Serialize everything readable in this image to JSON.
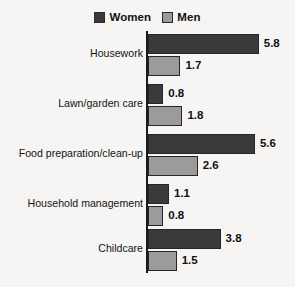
{
  "chart_data": {
    "type": "bar",
    "orientation": "horizontal",
    "title": "",
    "subtitle": "",
    "xlabel": "",
    "ylabel": "",
    "grid": false,
    "legend_position": "top-center",
    "xlim": [
      0,
      5.8
    ],
    "axis_tick_labels": [],
    "categories": [
      "Housework",
      "Lawn/garden care",
      "Food preparation/clean-up",
      "Household management",
      "Childcare"
    ],
    "series": [
      {
        "name": "Women",
        "color": "#3a3a3a",
        "values": [
          5.8,
          0.8,
          5.6,
          1.1,
          3.8
        ],
        "value_labels": [
          "5.8",
          "0.8",
          "5.6",
          "1.1",
          "3.8"
        ]
      },
      {
        "name": "Men",
        "color": "#9b9b9b",
        "values": [
          1.7,
          1.8,
          2.6,
          0.8,
          1.5
        ],
        "value_labels": [
          "1.7",
          "1.8",
          "2.6",
          "0.8",
          "1.5"
        ]
      }
    ]
  },
  "legend": {
    "entries": [
      {
        "label": "Women",
        "color": "#3a3a3a"
      },
      {
        "label": "Men",
        "color": "#9b9b9b"
      }
    ]
  },
  "colors": {
    "background": "#f6f5f3",
    "axis": "#1a1a1a",
    "women": "#3a3a3a",
    "men": "#9b9b9b",
    "text": "#111111"
  }
}
